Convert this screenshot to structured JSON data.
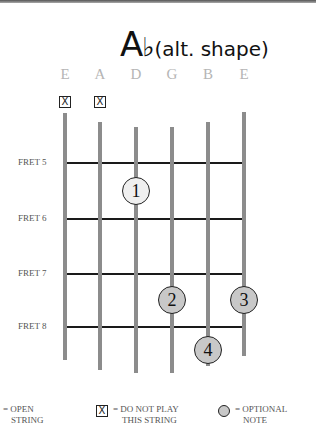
{
  "title": {
    "root": "A",
    "accidental": "♭",
    "suffix": "(alt. shape)"
  },
  "strings": [
    {
      "name": "E",
      "x": 65,
      "top": 113,
      "bottom": 360,
      "muted": true
    },
    {
      "name": "A",
      "x": 100,
      "top": 122,
      "bottom": 370,
      "muted": true
    },
    {
      "name": "D",
      "x": 136,
      "top": 127,
      "bottom": 373,
      "muted": false
    },
    {
      "name": "G",
      "x": 172,
      "top": 127,
      "bottom": 373,
      "muted": false
    },
    {
      "name": "B",
      "x": 208,
      "top": 122,
      "bottom": 366,
      "muted": false
    },
    {
      "name": "E",
      "x": 244,
      "top": 112,
      "bottom": 356,
      "muted": false
    }
  ],
  "mute_symbol": "X",
  "frets": [
    {
      "label": "FRET 5",
      "y": 163
    },
    {
      "label": "FRET 6",
      "y": 219
    },
    {
      "label": "FRET 7",
      "y": 274
    },
    {
      "label": "FRET 8",
      "y": 327
    }
  ],
  "notes": [
    {
      "finger": "1",
      "string": "D",
      "x": 136,
      "y": 191,
      "style": "light"
    },
    {
      "finger": "2",
      "string": "G",
      "x": 172,
      "y": 300,
      "style": "fill"
    },
    {
      "finger": "3",
      "string": "E",
      "x": 244,
      "y": 300,
      "style": "fill"
    },
    {
      "finger": "4",
      "string": "B",
      "x": 208,
      "y": 350,
      "style": "fill"
    }
  ],
  "legend": {
    "open": {
      "line1": "= OPEN",
      "line2": "STRING"
    },
    "mute": {
      "symbol": "X",
      "line1": "= DO NOT PLAY",
      "line2": "THIS STRING"
    },
    "optional": {
      "line1": "= OPTIONAL",
      "line2": "NOTE"
    }
  }
}
